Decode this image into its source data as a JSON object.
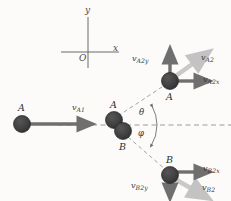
{
  "figure": {
    "background_color": "#fcfbfa",
    "width": 231,
    "height": 201
  },
  "colors": {
    "ball_fill": "#3d3d3d",
    "ball_stroke": "#1a1a1a",
    "vector_dark": "#6f6f6f",
    "vector_light": "#c3c3c3",
    "axis_line": "#6b6b6b",
    "dashed_line": "#9a9a9a",
    "arc_line": "#6e6e6e",
    "text": "#3a3a3a"
  },
  "axes": {
    "origin_label": "O",
    "x_label": "x",
    "y_label": "y"
  },
  "balls": [
    {
      "id": "ball-a-initial",
      "label": "A",
      "cx": 22,
      "cy": 124,
      "r": 8.5
    },
    {
      "id": "ball-a-collision",
      "label": "A",
      "cx": 114,
      "cy": 120,
      "r": 8.5
    },
    {
      "id": "ball-b-collision",
      "label": "B",
      "cx": 123,
      "cy": 131,
      "r": 8.5
    },
    {
      "id": "ball-a-final",
      "label": "A",
      "cx": 170,
      "cy": 81,
      "r": 8.5
    },
    {
      "id": "ball-b-final",
      "label": "B",
      "cx": 170,
      "cy": 175,
      "r": 8.5
    }
  ],
  "vectors": [
    {
      "id": "v-a1",
      "label_v": "v",
      "label_sub": "A1",
      "shade": "dark",
      "direction": "right"
    },
    {
      "id": "v-a2y",
      "label_v": "v",
      "label_sub": "A2y",
      "shade": "dark",
      "direction": "up"
    },
    {
      "id": "v-a2x",
      "label_v": "v",
      "label_sub": "A2x",
      "shade": "dark",
      "direction": "right"
    },
    {
      "id": "v-a2",
      "label_v": "v",
      "label_sub": "A2",
      "shade": "light",
      "direction": "up-right"
    },
    {
      "id": "v-b2x",
      "label_v": "v",
      "label_sub": "B2x",
      "shade": "dark",
      "direction": "right"
    },
    {
      "id": "v-b2y",
      "label_v": "v",
      "label_sub": "B2y",
      "shade": "dark",
      "direction": "down"
    },
    {
      "id": "v-b2",
      "label_v": "v",
      "label_sub": "B2",
      "shade": "light",
      "direction": "down-right"
    }
  ],
  "angles": [
    {
      "id": "angle-theta",
      "symbol": "θ",
      "position": "above-axis"
    },
    {
      "id": "angle-phi",
      "symbol": "φ",
      "position": "below-axis"
    }
  ],
  "labels": {
    "v_a1": {
      "v": "v",
      "sub": "A1"
    },
    "v_a2": {
      "v": "v",
      "sub": "A2"
    },
    "v_a2x": {
      "v": "v",
      "sub": "A2x"
    },
    "v_a2y": {
      "v": "v",
      "sub": "A2y"
    },
    "v_b2": {
      "v": "v",
      "sub": "B2"
    },
    "v_b2x": {
      "v": "v",
      "sub": "B2x"
    },
    "v_b2y": {
      "v": "v",
      "sub": "B2y"
    },
    "ball_a_initial": "A",
    "ball_a_collision": "A",
    "ball_b_collision": "B",
    "ball_a_final": "A",
    "ball_b_final": "B",
    "theta": "θ",
    "phi": "φ",
    "origin": "O",
    "axis_x": "x",
    "axis_y": "y"
  }
}
